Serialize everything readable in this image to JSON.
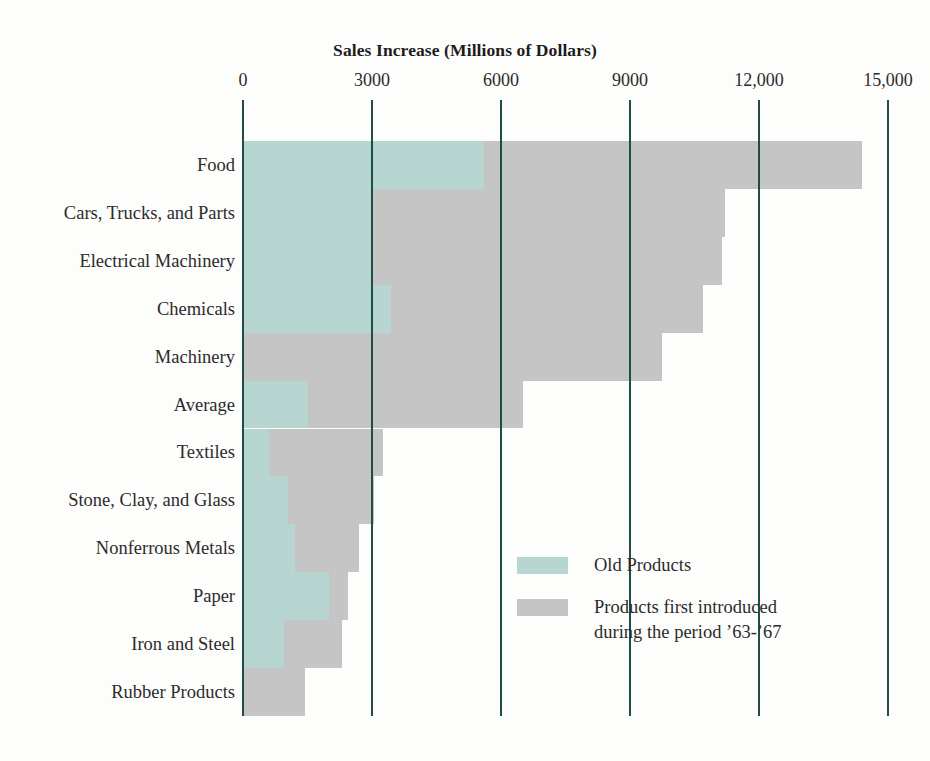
{
  "chart_data": {
    "type": "bar",
    "orientation": "horizontal",
    "stacked": true,
    "title": "Sales Increase (Millions of Dollars)",
    "xlabel": "",
    "ylabel": "",
    "xlim": [
      0,
      15000
    ],
    "xticks": [
      0,
      3000,
      6000,
      9000,
      12000,
      15000
    ],
    "xtick_labels": [
      "0",
      "3000",
      "6000",
      "9000",
      "12,000",
      "15,000"
    ],
    "grid": true,
    "legend_position": "inside-lower-right",
    "categories": [
      "Food",
      "Cars, Trucks, and Parts",
      "Electrical Machinery",
      "Chemicals",
      "Machinery",
      "Average",
      "Textiles",
      "Stone, Clay, and Glass",
      "Nonferrous Metals",
      "Paper",
      "Iron and Steel",
      "Rubber Products"
    ],
    "series": [
      {
        "name": "Old Products",
        "color": "#b7d6d1",
        "values": [
          5600,
          3000,
          3000,
          3450,
          0,
          1500,
          600,
          1050,
          1200,
          2000,
          950,
          0
        ]
      },
      {
        "name": "Products first introduced during the period '63-'67",
        "color": "#c5c5c5",
        "values": [
          8800,
          8200,
          8150,
          7250,
          9750,
          5000,
          2650,
          2000,
          1500,
          450,
          1350,
          1450
        ]
      }
    ],
    "totals": [
      14400,
      11200,
      11150,
      10700,
      9750,
      6500,
      3250,
      3050,
      2700,
      2450,
      2300,
      1450
    ]
  },
  "legend": {
    "items": [
      {
        "label": "Old Products",
        "label_line2": "",
        "color_key": "old"
      },
      {
        "label": "Products first introduced",
        "label_line2": "during the period ’63-’67",
        "color_key": "new"
      }
    ]
  },
  "colors": {
    "old_products": "#b7d6d1",
    "new_products": "#c5c5c5",
    "gridline": "#1d4f45",
    "text": "#2b2b2b",
    "background": "#fdfdfc"
  }
}
